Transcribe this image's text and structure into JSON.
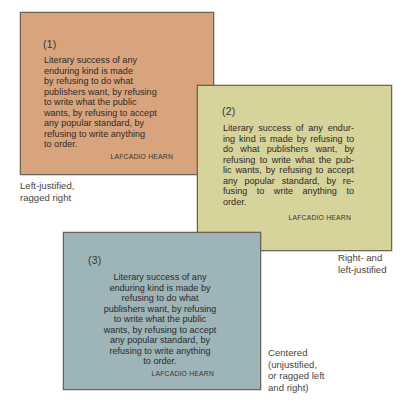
{
  "colors": {
    "card1_bg": "#d8a47d",
    "card2_bg": "#d6d39b",
    "card3_bg": "#9db4b9",
    "text": "#2f2a26"
  },
  "cards": [
    {
      "number": "(1)",
      "alignment": "left-justified",
      "lines": [
        "Literary success of any",
        "enduring kind is made",
        "by refusing to do what",
        "publishers want, by refusing",
        "to write what the public",
        "wants, by refusing to accept",
        "any popular standard, by",
        "refusing to write anything",
        "to order."
      ],
      "author": "LAFCADIO HEARN",
      "caption": [
        "Left-justified,",
        "ragged right"
      ]
    },
    {
      "number": "(2)",
      "alignment": "justified",
      "lines": [
        "Literary success of any endur-",
        "ing kind is made by refusing to",
        "do what publishers want, by",
        "refusing to write what the pub-",
        "lic wants, by refusing to accept",
        "any popular standard, by re-",
        "fusing to write anything to",
        "order."
      ],
      "author": "LAFCADIO HEARN",
      "caption": [
        "Right- and",
        "left-justified"
      ]
    },
    {
      "number": "(3)",
      "alignment": "centered",
      "lines": [
        "Literary success of any",
        "enduring kind is made by",
        "refusing to do what",
        "publishers want, by refusing",
        "to write what the public",
        "wants, by refusing to accept",
        "any popular standard, by",
        "refusing to write anything",
        "to order."
      ],
      "author": "LAFCADIO HEARN",
      "caption": [
        "Centered",
        "(unjustified,",
        "or ragged left",
        "and right)"
      ]
    }
  ]
}
